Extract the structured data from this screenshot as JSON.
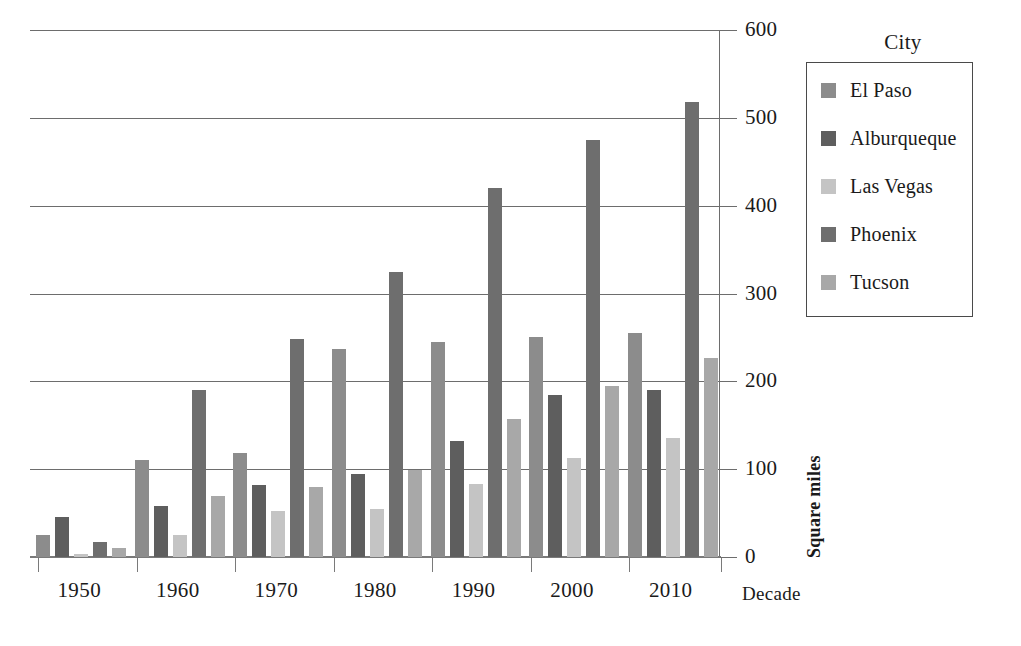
{
  "chart_data": {
    "type": "bar",
    "title": "",
    "xlabel": "Decade",
    "ylabel": "Square miles",
    "legend_title": "City",
    "legend_position": "right",
    "grid": true,
    "ylim": [
      0,
      600
    ],
    "yticks": [
      0,
      100,
      200,
      300,
      400,
      500,
      600
    ],
    "ytick_labels": [
      "0",
      "100",
      "200",
      "300",
      "400",
      "500",
      "600"
    ],
    "categories": [
      "1950",
      "1960",
      "1970",
      "1980",
      "1990",
      "2000",
      "2010"
    ],
    "series": [
      {
        "name": "El Paso",
        "color": "#8c8c8c",
        "values": [
          25,
          110,
          118,
          237,
          245,
          250,
          255
        ]
      },
      {
        "name": "Alburqueque",
        "color": "#5e5e5e",
        "values": [
          45,
          58,
          82,
          95,
          132,
          185,
          190
        ]
      },
      {
        "name": "Las Vegas",
        "color": "#c4c4c4",
        "values": [
          4,
          25,
          52,
          55,
          83,
          113,
          135
        ]
      },
      {
        "name": "Phoenix",
        "color": "#6e6e6e",
        "values": [
          17,
          190,
          248,
          325,
          420,
          475,
          518
        ]
      },
      {
        "name": "Tucson",
        "color": "#a8a8a8",
        "values": [
          10,
          70,
          80,
          99,
          157,
          195,
          227
        ]
      }
    ]
  }
}
